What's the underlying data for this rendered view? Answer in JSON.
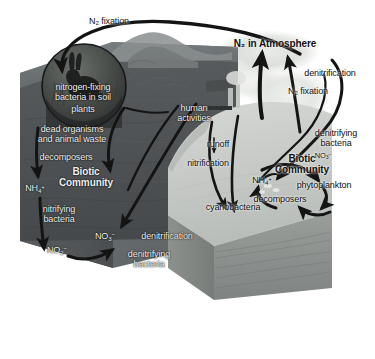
{
  "figure": {
    "type": "scientific-diagram",
    "palette": {
      "background": "#ffffff",
      "soil_front": "#4f5355",
      "soil_side": "#55595b",
      "land_top": "#6e7375",
      "water_surface": "#c9ccc8",
      "water_block_front": "#8f9391",
      "atmosphere_cloud": "#d9dcd8",
      "arrow": "#1b1b1b",
      "label_light": "#f2f2f0",
      "label_dark": "#111111"
    }
  },
  "atmosphere": {
    "label": "N₂ in Atmosphere"
  },
  "terrestrial": {
    "region_label": "Biotic Community",
    "inset": {
      "name": "nitrogen-fixing bacteria inset",
      "line1": "nitrogen-fixing",
      "line2": "bacteria in soil",
      "subject": "hare-in-grass"
    },
    "labels": {
      "n2_fixation_top": "N₂ fixation",
      "plants": "plants",
      "dead_organisms_l1": "dead organisms",
      "dead_organisms_l2": "and animal waste",
      "decomposers": "decomposers",
      "ammonium": "NH₄⁺",
      "nitrifying_l1": "nitrifying",
      "nitrifying_l2": "bacteria",
      "nitrite": "NO₂⁻",
      "nitrate": "NO₃⁻",
      "denitrification": "denitrification",
      "denitrifying_l1": "denitrifying",
      "denitrifying_l2": "bacteria"
    }
  },
  "human": {
    "label_l1": "human",
    "label_l2": "activities",
    "icon": "factory-with-smokestacks"
  },
  "aquatic": {
    "region_label": "Biotic Community",
    "labels": {
      "runoff": "runoff",
      "nitrification": "nitrification",
      "cyanobacteria": "cyanobacteria",
      "ammonium": "NH₄⁺",
      "nitrate": "NO₃⁻",
      "phytoplankton": "phytoplankton",
      "decomposers": "decomposers",
      "denitrifying_l1": "denitrifying",
      "denitrifying_l2": "bacteria"
    }
  },
  "fluxes": {
    "n2_fixation_right": "N₂ fixation",
    "denitrification_right": "denitrification"
  }
}
